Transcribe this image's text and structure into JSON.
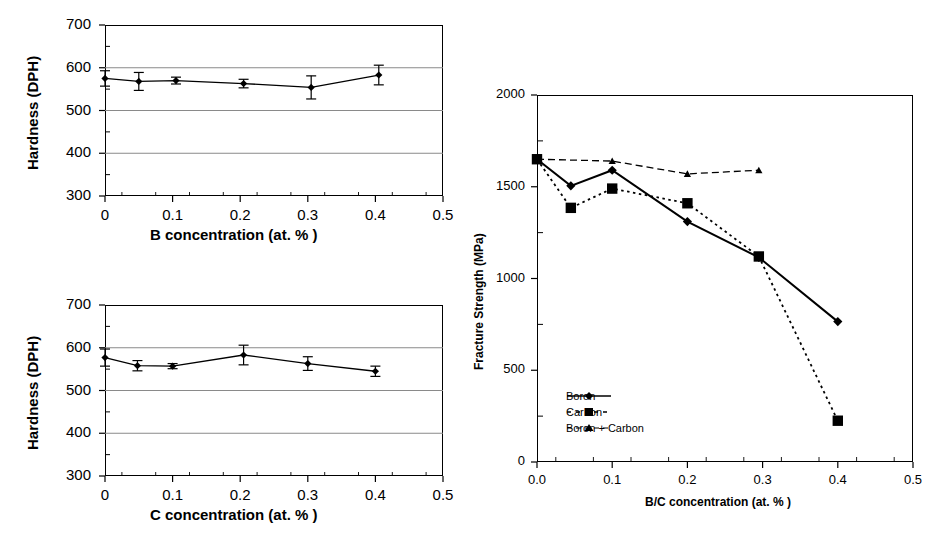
{
  "figure": {
    "panels": [
      "hardness-boron",
      "hardness-carbon",
      "fracture-strength"
    ]
  },
  "chart_data": [
    {
      "id": "hardness-boron",
      "type": "line",
      "title": "",
      "xlabel": "B concentration (at. % )",
      "ylabel": "Hardness (DPH)",
      "xlim": [
        0,
        0.5
      ],
      "ylim": [
        300,
        700
      ],
      "xticks": [
        "0",
        "0.1",
        "0.2",
        "0.3",
        "0.4",
        "0.5"
      ],
      "xtickvalues": [
        0,
        0.1,
        0.2,
        0.3,
        0.4,
        0.5
      ],
      "yticks": [
        "300",
        "400",
        "500",
        "600",
        "700"
      ],
      "ytickvalues": [
        300,
        400,
        500,
        600,
        700
      ],
      "grid": "horizontal",
      "minor_ticks": true,
      "series": [
        {
          "name": "Hardness vs B",
          "marker": "diamond",
          "line": "solid",
          "x": [
            0.0,
            0.05,
            0.105,
            0.205,
            0.305,
            0.405
          ],
          "values": [
            575,
            568,
            570,
            563,
            554,
            583
          ],
          "errors": [
            18,
            21,
            8,
            10,
            27,
            23
          ]
        }
      ]
    },
    {
      "id": "hardness-carbon",
      "type": "line",
      "title": "",
      "xlabel": "C concentration (at. % )",
      "ylabel": "Hardness (DPH)",
      "xlim": [
        0,
        0.5
      ],
      "ylim": [
        300,
        700
      ],
      "xticks": [
        "0",
        "0.1",
        "0.2",
        "0.3",
        "0.4",
        "0.5"
      ],
      "xtickvalues": [
        0,
        0.1,
        0.2,
        0.3,
        0.4,
        0.5
      ],
      "yticks": [
        "300",
        "400",
        "500",
        "600",
        "700"
      ],
      "ytickvalues": [
        300,
        400,
        500,
        600,
        700
      ],
      "grid": "horizontal",
      "minor_ticks": true,
      "series": [
        {
          "name": "Hardness vs C",
          "marker": "diamond",
          "line": "solid",
          "x": [
            0.0,
            0.048,
            0.1,
            0.205,
            0.3,
            0.4
          ],
          "values": [
            577,
            558,
            557,
            583,
            563,
            545
          ],
          "errors": [
            20,
            12,
            6,
            23,
            16,
            12
          ]
        }
      ]
    },
    {
      "id": "fracture-strength",
      "type": "line",
      "title": "",
      "xlabel": "B/C concentration (at. % )",
      "ylabel": "Fracture Strength (MPa)",
      "xlim": [
        0,
        0.5
      ],
      "ylim": [
        0,
        2000
      ],
      "xticks": [
        "0.0",
        "0.1",
        "0.2",
        "0.3",
        "0.4",
        "0.5"
      ],
      "xtickvalues": [
        0,
        0.1,
        0.2,
        0.3,
        0.4,
        0.5
      ],
      "yticks": [
        "0",
        "500",
        "1000",
        "1500",
        "2000"
      ],
      "ytickvalues": [
        0,
        500,
        1000,
        1500,
        2000
      ],
      "grid": "none",
      "minor_ticks": true,
      "legend_position": "lower-left-inside",
      "series": [
        {
          "name": "Boron",
          "marker": "diamond",
          "line": "solid",
          "x": [
            0.0,
            0.045,
            0.1,
            0.2,
            0.295,
            0.4
          ],
          "values": [
            1650,
            1505,
            1590,
            1310,
            1115,
            765
          ]
        },
        {
          "name": "Carbon",
          "marker": "square",
          "line": "dotted",
          "x": [
            0.0,
            0.045,
            0.1,
            0.2,
            0.295,
            0.4
          ],
          "values": [
            1650,
            1385,
            1490,
            1410,
            1120,
            225
          ]
        },
        {
          "name": "Boron + Carbon",
          "marker": "triangle",
          "line": "dashed",
          "x": [
            0.0,
            0.1,
            0.2,
            0.295
          ],
          "values": [
            1650,
            1640,
            1570,
            1590
          ]
        }
      ]
    }
  ]
}
